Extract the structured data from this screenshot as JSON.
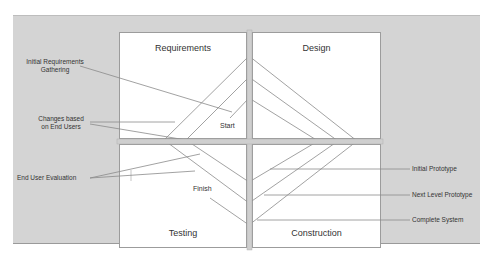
{
  "diagram": {
    "type": "spiral-prototyping-model",
    "quadrants": [
      {
        "id": "requirements",
        "title": "Requirements"
      },
      {
        "id": "design",
        "title": "Design"
      },
      {
        "id": "testing",
        "title": "Testing"
      },
      {
        "id": "construction",
        "title": "Construction"
      }
    ],
    "markers": {
      "start": "Start",
      "finish": "Finish"
    },
    "left_labels": [
      {
        "id": "initial-requirements",
        "line1": "Initial Requirements",
        "line2": "Gathering"
      },
      {
        "id": "changes-end-users",
        "line1": "Changes based",
        "line2": "on End Users"
      },
      {
        "id": "end-user-evaluation",
        "line1": "End User Evaluation"
      }
    ],
    "right_labels": [
      {
        "id": "initial-prototype",
        "text": "Initial Prototype"
      },
      {
        "id": "next-level-prototype",
        "text": "Next Level Prototype"
      },
      {
        "id": "complete-system",
        "text": "Complete System"
      }
    ],
    "colors": {
      "panel": "#d4d4d4",
      "box": "#ffffff",
      "line": "#8a8a8a",
      "text": "#333333"
    }
  }
}
